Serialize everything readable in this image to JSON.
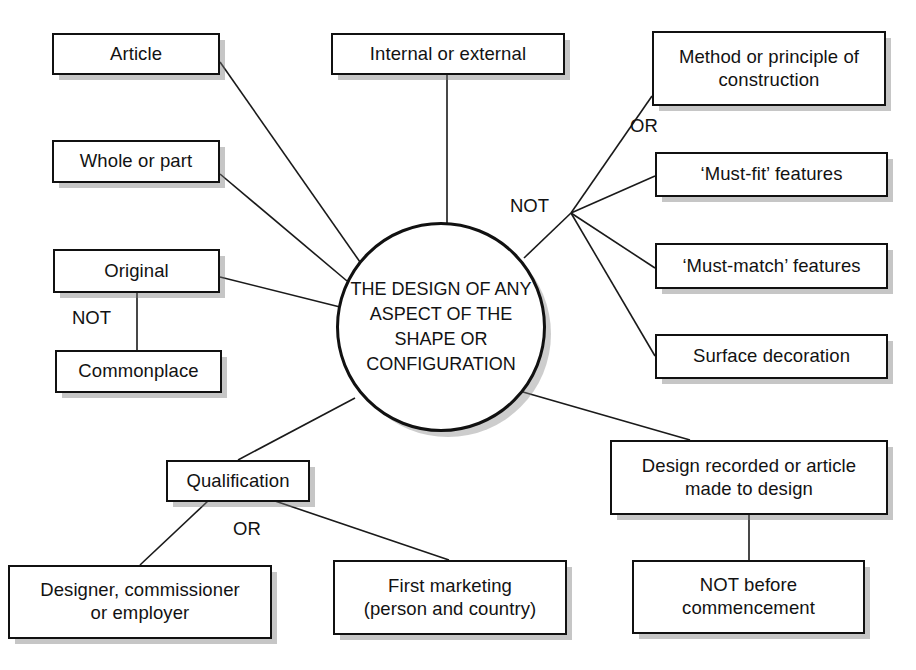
{
  "diagram": {
    "hub": {
      "text": "THE DESIGN OF ANY ASPECT OF THE SHAPE OR CONFIGURATION",
      "lines": [
        "THE DESIGN OF",
        "ANY ASPECT OF",
        "THE SHAPE OR",
        "CONFIGURATION"
      ]
    },
    "nodes": [
      {
        "id": "article",
        "label": "Article",
        "lines": [
          "Article"
        ]
      },
      {
        "id": "whole-or-part",
        "label": "Whole or part",
        "lines": [
          "Whole or part"
        ]
      },
      {
        "id": "original",
        "label": "Original",
        "lines": [
          "Original"
        ]
      },
      {
        "id": "commonplace",
        "label": "Commonplace",
        "lines": [
          "Commonplace"
        ]
      },
      {
        "id": "internal-or-external",
        "label": "Internal or external",
        "lines": [
          "Internal or external"
        ]
      },
      {
        "id": "method-or-principle-of-construction",
        "label": "Method or principle of construction",
        "lines": [
          "Method or principle of",
          "construction"
        ]
      },
      {
        "id": "must-fit-features",
        "label": "‘Must-fit’ features",
        "lines": [
          "‘Must-fit’ features"
        ]
      },
      {
        "id": "must-match-features",
        "label": "‘Must-match’ features",
        "lines": [
          "‘Must-match’ features"
        ]
      },
      {
        "id": "surface-decoration",
        "label": "Surface decoration",
        "lines": [
          "Surface decoration"
        ]
      },
      {
        "id": "qualification",
        "label": "Qualification",
        "lines": [
          "Qualification"
        ]
      },
      {
        "id": "designer-commissioner-or-employer",
        "label": "Designer, commissioner or employer",
        "lines": [
          "Designer, commissioner",
          "or employer"
        ]
      },
      {
        "id": "first-marketing",
        "label": "First marketing (person and country)",
        "lines": [
          "First marketing",
          "(person and country)"
        ]
      },
      {
        "id": "design-recorded-or-article-made-to-design",
        "label": "Design recorded or article made to design",
        "lines": [
          "Design recorded or article",
          "made to design"
        ]
      },
      {
        "id": "not-before-commencement",
        "label": "NOT before commencement",
        "lines": [
          "NOT before",
          "commencement"
        ]
      }
    ],
    "connector_labels": [
      {
        "id": "not-original-commonplace",
        "text": "NOT"
      },
      {
        "id": "not-exclusions",
        "text": "NOT"
      },
      {
        "id": "or-exclusions",
        "text": "OR"
      },
      {
        "id": "or-qualification",
        "text": "OR"
      }
    ],
    "colors": {
      "line": "#1a1a1a",
      "box_border": "#111111",
      "box_fill": "#ffffff",
      "text": "#121212",
      "shadow": "#808080",
      "background": "#ffffff"
    }
  }
}
